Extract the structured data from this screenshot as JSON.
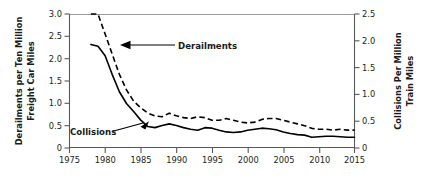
{
  "chart_data": {
    "type": "line",
    "title": "",
    "xlabel": "",
    "ylabel": "Derailments per Ten Million Freight Car Miles",
    "y2label": "Collisions Per Million Train Miles",
    "xlim": [
      1975,
      2015
    ],
    "ylim": [
      0,
      3.0
    ],
    "y2lim": [
      0,
      2.5
    ],
    "grid": false,
    "legend_position": "inline-annotations",
    "xticks": [
      1975,
      1980,
      1985,
      1990,
      1995,
      2000,
      2005,
      2010,
      2015
    ],
    "xtick_labels": [
      "1975",
      "1980",
      "1985",
      "1990",
      "1995",
      "2000",
      "2005",
      "2010",
      "2015"
    ],
    "yticks": [
      0,
      0.5,
      1.0,
      1.5,
      2.0,
      2.5,
      3.0
    ],
    "ytick_labels": [
      "0",
      "0.5",
      "1.0",
      "1.5",
      "2.0",
      "2.5",
      "3.0"
    ],
    "y2ticks": [
      0,
      0.5,
      1.0,
      1.5,
      2.0,
      2.5
    ],
    "y2tick_labels": [
      "0",
      "0.5",
      "1.0",
      "1.5",
      "2.0",
      "2.5"
    ],
    "annotations": [
      {
        "text": "Derailments",
        "series": "derailments",
        "x": 1981.5,
        "y": 1.95
      },
      {
        "text": "Collisions",
        "series": "collisions",
        "x": 1983.0,
        "y": 0.52
      }
    ],
    "series": [
      {
        "name": "Derailments",
        "style": "dashed",
        "axis": "left",
        "units": "derailments per ten million freight car miles",
        "x": [
          1978,
          1979,
          1980,
          1981,
          1982,
          1983,
          1984,
          1985,
          1986,
          1987,
          1988,
          1989,
          1990,
          1991,
          1992,
          1993,
          1994,
          1995,
          1996,
          1997,
          1998,
          1999,
          2000,
          2001,
          2002,
          2003,
          2004,
          2005,
          2006,
          2007,
          2008,
          2009,
          2010,
          2011,
          2012,
          2013,
          2014,
          2015
        ],
        "values": [
          3.3,
          3.0,
          2.55,
          2.1,
          1.65,
          1.3,
          1.05,
          0.9,
          0.78,
          0.72,
          0.7,
          0.78,
          0.72,
          0.68,
          0.66,
          0.7,
          0.68,
          0.62,
          0.62,
          0.66,
          0.62,
          0.58,
          0.56,
          0.58,
          0.64,
          0.66,
          0.66,
          0.62,
          0.58,
          0.54,
          0.5,
          0.44,
          0.42,
          0.42,
          0.4,
          0.42,
          0.4,
          0.4
        ]
      },
      {
        "name": "Collisions",
        "style": "solid",
        "axis": "right",
        "units": "collisions per million train miles",
        "x": [
          1978,
          1979,
          1980,
          1981,
          1982,
          1983,
          1984,
          1985,
          1986,
          1987,
          1988,
          1989,
          1990,
          1991,
          1992,
          1993,
          1994,
          1995,
          1996,
          1997,
          1998,
          1999,
          2000,
          2001,
          2002,
          2003,
          2004,
          2005,
          2006,
          2007,
          2008,
          2009,
          2010,
          2011,
          2012,
          2013,
          2014,
          2015
        ],
        "values": [
          1.93,
          1.9,
          1.72,
          1.37,
          1.05,
          0.83,
          0.68,
          0.52,
          0.4,
          0.38,
          0.42,
          0.45,
          0.42,
          0.38,
          0.35,
          0.33,
          0.38,
          0.37,
          0.33,
          0.3,
          0.29,
          0.3,
          0.33,
          0.35,
          0.37,
          0.36,
          0.34,
          0.3,
          0.27,
          0.25,
          0.24,
          0.2,
          0.21,
          0.22,
          0.22,
          0.21,
          0.2,
          0.2
        ]
      }
    ]
  },
  "axes": {
    "left_title": "Derailments per Ten Million\nFreight Car Miles",
    "left_title_line1": "Derailments per Ten Million",
    "left_title_line2": "Freight Car Miles",
    "right_title_line1": "Collisions Per Million",
    "right_title_line2": "Train Miles"
  }
}
